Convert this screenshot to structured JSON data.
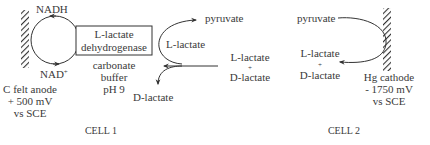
{
  "cell1": {
    "cofactor_top": "NADH",
    "cofactor_bottom": "NAD",
    "cofactor_bottom_sup": "+",
    "enzyme_line1": "L-lactate",
    "enzyme_line2": "dehydrogenase",
    "buffer_line1": "carbonate",
    "buffer_line2": "buffer",
    "buffer_line3": "pH 9",
    "electrode_line1": "C felt anode",
    "electrode_line2": "+ 500 mV",
    "electrode_line3": "vs SCE",
    "product": "pyruvate",
    "intermediate": "L-lactate",
    "substrate_line1": "L-lactate",
    "substrate_plus": "+",
    "substrate_line2": "D-lactate",
    "remaining": "D-lactate",
    "caption": "CELL 1"
  },
  "cell2": {
    "substrate": "pyruvate",
    "product_line1": "L-lactate",
    "product_plus": "+",
    "product_line2": "D-lactate",
    "electrode_line1": "Hg cathode",
    "electrode_line2": "- 1750 mV",
    "electrode_line3": "vs SCE",
    "caption": "CELL 2"
  },
  "colors": {
    "ink": "#3a3a3a"
  }
}
